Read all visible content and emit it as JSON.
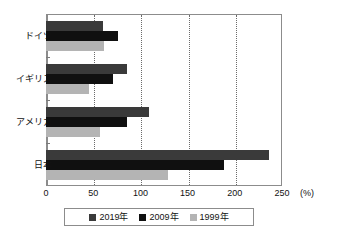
{
  "chart_data": {
    "type": "bar",
    "orientation": "horizontal",
    "title": "",
    "xlabel": "(%)",
    "ylabel": "",
    "categories": [
      "ドイツ",
      "イギリス",
      "アメリカ",
      "日本"
    ],
    "series": [
      {
        "name": "2019年",
        "color": "#3a3a3a",
        "values": [
          60,
          86,
          109,
          236
        ]
      },
      {
        "name": "2009年",
        "color": "#101010",
        "values": [
          76,
          71,
          86,
          189
        ]
      },
      {
        "name": "1999年",
        "color": "#b4b4b4",
        "values": [
          61,
          46,
          57,
          129
        ]
      }
    ],
    "xlim": [
      0,
      250
    ],
    "xticks": [
      0,
      50,
      100,
      150,
      200,
      250
    ],
    "xtick_labels": [
      "0",
      "50",
      "100",
      "150",
      "200",
      "250"
    ],
    "unit": "(%)",
    "grid": true,
    "grid_axis": "x",
    "legend_position": "bottom"
  },
  "legend": {
    "items": [
      {
        "label": "2019年",
        "swatch": "legend-swatch-2019"
      },
      {
        "label": "2009年",
        "swatch": "legend-swatch-2009"
      },
      {
        "label": "1999年",
        "swatch": "legend-swatch-1999"
      }
    ]
  }
}
